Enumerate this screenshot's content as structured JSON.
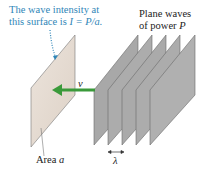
{
  "caption_intensity": {
    "line1": "The wave intensity at",
    "line2_prefix": "this surface is ",
    "formula": "I = P/a."
  },
  "caption_waves": {
    "line1": "Plane waves",
    "line2_prefix": "of power ",
    "symbol": "P"
  },
  "velocity_label": "v",
  "area_label": {
    "prefix": "Area ",
    "symbol": "a"
  },
  "wavelength_label": "λ",
  "colors": {
    "annotation_blue": "#2f86b8",
    "arrow_green": "#3a9a3a",
    "surface_tan": "#e6dcd2",
    "wave_gray": "#a9a9a9"
  },
  "wave_planes_count": 5
}
